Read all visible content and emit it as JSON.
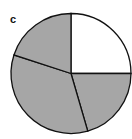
{
  "panel_label": "c",
  "chart_data": {
    "type": "pie",
    "title": "",
    "start_angle": "12 o'clock",
    "direction": "clockwise",
    "slices": [
      {
        "label": "",
        "value": 25,
        "color": "#ffffff"
      },
      {
        "label": "",
        "value": 20.5,
        "color": "#a6a6a6"
      },
      {
        "label": "",
        "value": 34.5,
        "color": "#a6a6a6"
      },
      {
        "label": "",
        "value": 20,
        "color": "#a6a6a6"
      }
    ],
    "edge_color": "#111111",
    "legend": "none"
  }
}
